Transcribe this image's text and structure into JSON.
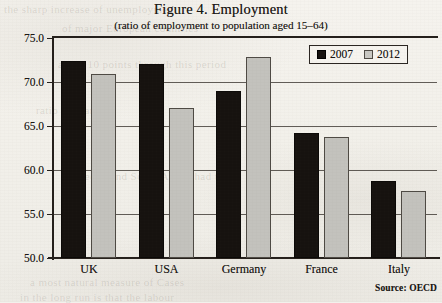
{
  "chart_data": {
    "type": "bar",
    "title": "Figure 4. Employment",
    "subtitle": "(ratio of employment to population aged 15–64)",
    "xlabel": "",
    "ylabel": "",
    "ylim": [
      50.0,
      75.0
    ],
    "ytick_step": 5.0,
    "ytick_labels": [
      "75.0",
      "70.0",
      "65.0",
      "60.0",
      "55.0",
      "50.0"
    ],
    "ytick_values": [
      75.0,
      70.0,
      65.0,
      60.0,
      55.0,
      50.0
    ],
    "grid": "horizontal",
    "legend_position": "top-right",
    "categories": [
      "UK",
      "USA",
      "Germany",
      "France",
      "Italy"
    ],
    "series": [
      {
        "name": "2007",
        "color": "#16120f",
        "values": [
          72.4,
          72.0,
          69.0,
          64.2,
          58.7
        ]
      },
      {
        "name": "2012",
        "color": "#c3c2bd",
        "values": [
          70.9,
          67.1,
          72.8,
          63.8,
          57.6
        ]
      }
    ],
    "source": "Source: OECD"
  },
  "legend": {
    "items": [
      {
        "label": "2007",
        "swatch": "black-square-icon"
      },
      {
        "label": "2012",
        "swatch": "gray-square-icon"
      }
    ]
  },
  "page_bleed_text": [
    "the sharp increase of unemployment",
    "of major European countries",
    "about 10 points through this period",
    "ratio in France",
    "Sweden and South Africa had the",
    "a most natural measure of Cases",
    "in the long run is that the labour"
  ]
}
